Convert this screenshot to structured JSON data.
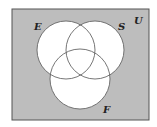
{
  "diagram": {
    "type": "venn",
    "universe": {
      "label": "U",
      "fill": "#bdbdbd"
    },
    "sets": [
      {
        "label": "E",
        "cx": 66,
        "cy": 50,
        "r": 29
      },
      {
        "label": "S",
        "cx": 95,
        "cy": 50,
        "r": 29
      },
      {
        "label": "F",
        "cx": 80,
        "cy": 79,
        "r": 30
      }
    ],
    "labels": {
      "u": "U",
      "e": "E",
      "s": "S",
      "f": "F"
    }
  }
}
